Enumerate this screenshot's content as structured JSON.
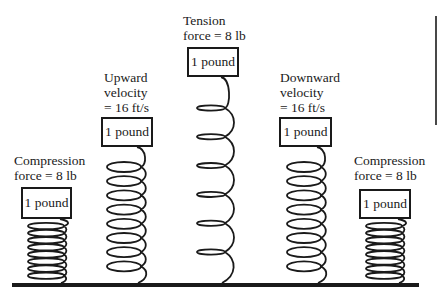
{
  "colors": {
    "ink": "#1a1a1a",
    "background": "#ffffff"
  },
  "ground": {
    "x1": 12,
    "x2": 419,
    "y": 285,
    "thickness": 4
  },
  "right_edge_line": {
    "x": 436,
    "y1": 16,
    "y2": 125
  },
  "springs": [
    {
      "id": "compression-left",
      "label_lines": [
        "Compression",
        "force = 8 lb"
      ],
      "label_pos": {
        "x": 14,
        "y": 153
      },
      "mass_label": "1 pound",
      "box": {
        "x": 21,
        "y": 187,
        "w": 51,
        "h": 32
      },
      "coil": {
        "cx": 46,
        "rx": 18,
        "ry": 3.2,
        "top": 219,
        "first": 226,
        "spacing": 7.1,
        "count": 8,
        "attach_x": 64
      }
    },
    {
      "id": "upward-velocity",
      "label_lines": [
        "Upward",
        "velocity",
        "= 16 ft/s"
      ],
      "label_pos": {
        "x": 104,
        "y": 70
      },
      "mass_label": "1 pound",
      "box": {
        "x": 101,
        "y": 117,
        "w": 52,
        "h": 30
      },
      "coil": {
        "cx": 124,
        "rx": 17,
        "ry": 5,
        "top": 147,
        "first": 167,
        "spacing": 14.2,
        "count": 8,
        "attach_x": 141
      }
    },
    {
      "id": "tension-center",
      "label_lines": [
        "Tension",
        "force = 8 lb"
      ],
      "label_pos": {
        "x": 183,
        "y": 13
      },
      "mass_label": "1 pound",
      "box": {
        "x": 187,
        "y": 47,
        "w": 52,
        "h": 30
      },
      "coil": {
        "cx": 211,
        "rx": 14,
        "ry": 2.6,
        "top": 77,
        "first": 108,
        "spacing": 28.8,
        "count": 6,
        "attach_x": 225
      }
    },
    {
      "id": "downward-velocity",
      "label_lines": [
        "Downward",
        "velocity",
        "= 16 ft/s"
      ],
      "label_pos": {
        "x": 280,
        "y": 70
      },
      "mass_label": "1 pound",
      "box": {
        "x": 279,
        "y": 117,
        "w": 53,
        "h": 30
      },
      "coil": {
        "cx": 304,
        "rx": 17,
        "ry": 5,
        "top": 147,
        "first": 167,
        "spacing": 14.2,
        "count": 8,
        "attach_x": 321
      }
    },
    {
      "id": "compression-right",
      "label_lines": [
        "Compression",
        "force = 8 lb"
      ],
      "label_pos": {
        "x": 354,
        "y": 153
      },
      "mass_label": "1 pound",
      "box": {
        "x": 359,
        "y": 189,
        "w": 52,
        "h": 30
      },
      "coil": {
        "cx": 384,
        "rx": 18,
        "ry": 3.2,
        "top": 219,
        "first": 226,
        "spacing": 7.1,
        "count": 8,
        "attach_x": 402
      }
    }
  ]
}
